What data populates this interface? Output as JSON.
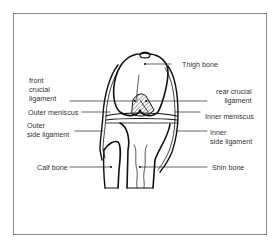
{
  "diagram": {
    "labels": {
      "thigh_bone": "Thigh bone",
      "front_crucial_ligament": [
        "front",
        "crucial",
        "ligament"
      ],
      "rear_crucial_ligament": [
        "rear crucial",
        "ligament"
      ],
      "outer_meniscus": "Outer meniscus",
      "inner_meniscus": "Inner meniscus",
      "outer_side_ligament": [
        "Outer",
        "side ligament"
      ],
      "inner_side_ligament": [
        "Inner",
        "side ligament"
      ],
      "calf_bone": "Calf bone",
      "shin_bone": "Shin bone"
    },
    "colors": {
      "line": "#111111",
      "frame": "#8a8a8a",
      "text": "#333333"
    }
  }
}
